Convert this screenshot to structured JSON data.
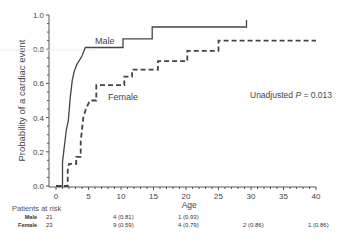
{
  "chart_data": {
    "type": "line",
    "subtype": "kaplan-meier-cumulative-incidence",
    "title": "",
    "xlabel": "Age",
    "ylabel": "Probability of a cardiac event",
    "xlim": [
      0,
      40
    ],
    "ylim": [
      0.0,
      1.0
    ],
    "xticks": [
      "0",
      "5",
      "10",
      "15",
      "20",
      "25",
      "30",
      "35",
      "40"
    ],
    "yticks": [
      "0.0",
      "0.2",
      "0.4",
      "0.6",
      "0.8",
      "1.0"
    ],
    "grid": false,
    "annotation": {
      "prefix": "Unadjusted ",
      "p_symbol": "P",
      "suffix": " = 0.013"
    },
    "series": [
      {
        "name": "Male",
        "style": "solid",
        "points": [
          [
            0,
            0.0
          ],
          [
            1.0,
            0.0
          ],
          [
            1.0,
            0.14
          ],
          [
            1.3,
            0.24
          ],
          [
            1.6,
            0.33
          ],
          [
            1.9,
            0.38
          ],
          [
            2.2,
            0.52
          ],
          [
            2.5,
            0.62
          ],
          [
            2.8,
            0.67
          ],
          [
            3.2,
            0.71
          ],
          [
            4.0,
            0.76
          ],
          [
            4.5,
            0.81
          ],
          [
            10.3,
            0.81
          ],
          [
            10.3,
            0.86
          ],
          [
            14.8,
            0.86
          ],
          [
            14.8,
            0.93
          ],
          [
            29.3,
            0.93
          ],
          [
            29.3,
            0.97
          ]
        ]
      },
      {
        "name": "Female",
        "style": "dashed",
        "points": [
          [
            0,
            0.0
          ],
          [
            1.8,
            0.0
          ],
          [
            1.8,
            0.09
          ],
          [
            2.0,
            0.13
          ],
          [
            3.1,
            0.13
          ],
          [
            3.1,
            0.17
          ],
          [
            3.8,
            0.17
          ],
          [
            3.8,
            0.26
          ],
          [
            4.2,
            0.4
          ],
          [
            4.6,
            0.45
          ],
          [
            5.2,
            0.5
          ],
          [
            6.2,
            0.5
          ],
          [
            6.2,
            0.59
          ],
          [
            10.5,
            0.59
          ],
          [
            10.5,
            0.64
          ],
          [
            11.7,
            0.64
          ],
          [
            11.7,
            0.68
          ],
          [
            15.7,
            0.68
          ],
          [
            15.7,
            0.73
          ],
          [
            20.2,
            0.73
          ],
          [
            20.2,
            0.79
          ],
          [
            25.0,
            0.79
          ],
          [
            25.0,
            0.85
          ],
          [
            40,
            0.85
          ]
        ]
      }
    ]
  },
  "legend_labels": {
    "male": "Male",
    "female": "Female"
  },
  "risk_table": {
    "title": "Patients at risk",
    "rows": [
      {
        "label": "Male",
        "entries": [
          {
            "x": 0,
            "text": "21"
          },
          {
            "x": 10,
            "text": "4 (0.81)"
          },
          {
            "x": 20,
            "text": "1 (0.93)"
          }
        ]
      },
      {
        "label": "Female",
        "entries": [
          {
            "x": 0,
            "text": "23"
          },
          {
            "x": 10,
            "text": "9 (0.59)"
          },
          {
            "x": 20,
            "text": "4 (0.79)"
          },
          {
            "x": 30,
            "text": "2 (0.86)"
          },
          {
            "x": 40,
            "text": "1 (0.86)"
          }
        ]
      }
    ]
  }
}
